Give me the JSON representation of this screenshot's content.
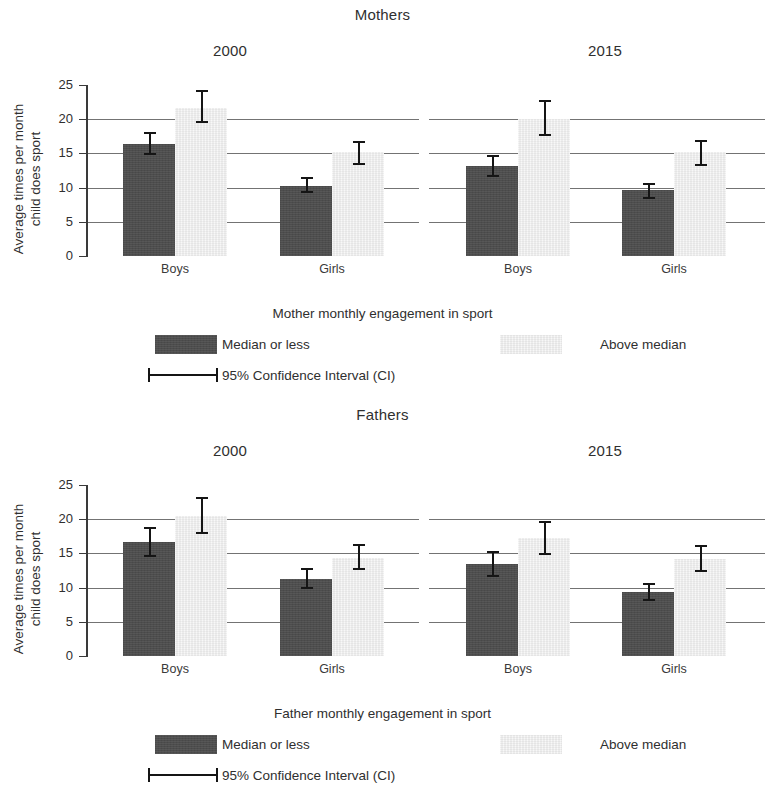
{
  "figure": {
    "y_axis_label_line1": "Average times per month",
    "y_axis_label_line2": "child does sport",
    "y_ticks": [
      "0",
      "5",
      "10",
      "15",
      "20",
      "25"
    ],
    "categories": [
      "Boys",
      "Girls"
    ],
    "colors": {
      "series_dark": "#4d4d4d",
      "series_light": "#ededed",
      "axis": "#3a3a3a",
      "gridline": "#5a5a5a",
      "error_bar": "#151515",
      "text": "#2f2f2f"
    }
  },
  "panels": [
    {
      "id": "mothers",
      "title": "Mothers",
      "year_left": "2000",
      "year_right": "2015",
      "x_axis_title": "Mother monthly engagement in sport",
      "legend": {
        "dark_label": "Median or less",
        "light_label": "Above median",
        "ci_label": "95% Confidence Interval (CI)"
      }
    },
    {
      "id": "fathers",
      "title": "Fathers",
      "year_left": "2000",
      "year_right": "2015",
      "x_axis_title": "Father monthly engagement in sport",
      "legend": {
        "dark_label": "Median or less",
        "light_label": "Above median",
        "ci_label": "95% Confidence Interval (CI)"
      }
    }
  ],
  "chart_data": [
    {
      "type": "bar",
      "title": "Mothers",
      "subtitle": "Mother monthly engagement in sport",
      "xlabel": "Mother monthly engagement in sport",
      "ylabel": "Average times per month child does sport",
      "ylim": [
        0,
        25
      ],
      "yticks": [
        0,
        5,
        10,
        15,
        20,
        25
      ],
      "grid": "horizontal",
      "legend_position": "bottom",
      "groups": [
        "2000",
        "2015"
      ],
      "categories": [
        "Boys",
        "Girls"
      ],
      "series": [
        {
          "name": "Median or less",
          "color": "#4d4d4d",
          "values": [
            {
              "group": "2000",
              "category": "Boys",
              "value": 16.4,
              "ci_low": 14.8,
              "ci_high": 18.1
            },
            {
              "group": "2000",
              "category": "Girls",
              "value": 10.3,
              "ci_low": 9.2,
              "ci_high": 11.5
            },
            {
              "group": "2015",
              "category": "Boys",
              "value": 13.1,
              "ci_low": 11.6,
              "ci_high": 14.7
            },
            {
              "group": "2015",
              "category": "Girls",
              "value": 9.6,
              "ci_low": 8.3,
              "ci_high": 10.7
            }
          ]
        },
        {
          "name": "Above median",
          "color": "#ededed",
          "values": [
            {
              "group": "2000",
              "category": "Boys",
              "value": 21.6,
              "ci_low": 19.4,
              "ci_high": 24.2
            },
            {
              "group": "2000",
              "category": "Girls",
              "value": 15.2,
              "ci_low": 13.3,
              "ci_high": 16.8
            },
            {
              "group": "2015",
              "category": "Boys",
              "value": 20.1,
              "ci_low": 17.5,
              "ci_high": 22.8
            },
            {
              "group": "2015",
              "category": "Girls",
              "value": 15.2,
              "ci_low": 13.2,
              "ci_high": 16.9
            }
          ]
        }
      ],
      "error_bars": "95% Confidence Interval (CI)"
    },
    {
      "type": "bar",
      "title": "Fathers",
      "subtitle": "Father monthly engagement in sport",
      "xlabel": "Father monthly engagement in sport",
      "ylabel": "Average times per month child does sport",
      "ylim": [
        0,
        25
      ],
      "yticks": [
        0,
        5,
        10,
        15,
        20,
        25
      ],
      "grid": "horizontal",
      "legend_position": "bottom",
      "groups": [
        "2000",
        "2015"
      ],
      "categories": [
        "Boys",
        "Girls"
      ],
      "series": [
        {
          "name": "Median or less",
          "color": "#4d4d4d",
          "values": [
            {
              "group": "2000",
              "category": "Boys",
              "value": 16.6,
              "ci_low": 14.5,
              "ci_high": 18.8
            },
            {
              "group": "2000",
              "category": "Girls",
              "value": 11.3,
              "ci_low": 9.8,
              "ci_high": 12.8
            },
            {
              "group": "2015",
              "category": "Boys",
              "value": 13.4,
              "ci_low": 11.5,
              "ci_high": 15.3
            },
            {
              "group": "2015",
              "category": "Girls",
              "value": 9.4,
              "ci_low": 8.0,
              "ci_high": 10.7
            }
          ]
        },
        {
          "name": "Above median",
          "color": "#ededed",
          "values": [
            {
              "group": "2000",
              "category": "Boys",
              "value": 20.4,
              "ci_low": 17.8,
              "ci_high": 23.3
            },
            {
              "group": "2000",
              "category": "Girls",
              "value": 14.3,
              "ci_low": 12.6,
              "ci_high": 16.4
            },
            {
              "group": "2015",
              "category": "Boys",
              "value": 17.2,
              "ci_low": 14.8,
              "ci_high": 19.7
            },
            {
              "group": "2015",
              "category": "Girls",
              "value": 14.2,
              "ci_low": 12.3,
              "ci_high": 16.2
            }
          ]
        }
      ],
      "error_bars": "95% Confidence Interval (CI)"
    }
  ]
}
